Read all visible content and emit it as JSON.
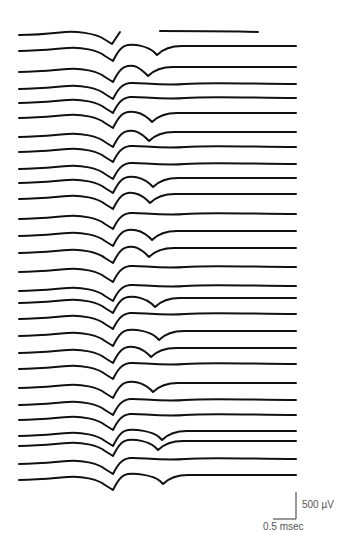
{
  "figure": {
    "type": "stacked-waveform-traces",
    "trace_color": "#111111",
    "x_start": 19,
    "x_end": 296,
    "scale_bar": {
      "vertical_label": "500 µV",
      "horizontal_label": "0.5 msec"
    },
    "traces": [
      {
        "y": 35,
        "t2": null,
        "broken": true
      },
      {
        "y": 51,
        "t2": 157
      },
      {
        "y": 72,
        "t2": 148
      },
      {
        "y": 89,
        "t2": null
      },
      {
        "y": 103,
        "t2": null
      },
      {
        "y": 118,
        "t2": 152
      },
      {
        "y": 137,
        "t2": 149
      },
      {
        "y": 152,
        "t2": null
      },
      {
        "y": 169,
        "t2": null
      },
      {
        "y": 183,
        "t2": 153
      },
      {
        "y": 199,
        "t2": 150
      },
      {
        "y": 219,
        "t2": null
      },
      {
        "y": 236,
        "t2": 152
      },
      {
        "y": 253,
        "t2": 149
      },
      {
        "y": 272,
        "t2": null
      },
      {
        "y": 291,
        "t2": null
      },
      {
        "y": 303,
        "t2": 155
      },
      {
        "y": 319,
        "t2": null
      },
      {
        "y": 336,
        "t2": 159
      },
      {
        "y": 353,
        "t2": 151
      },
      {
        "y": 369,
        "t2": null
      },
      {
        "y": 388,
        "t2": 153
      },
      {
        "y": 405,
        "t2": null
      },
      {
        "y": 420,
        "t2": null
      },
      {
        "y": 436,
        "t2": 162
      },
      {
        "y": 446,
        "t2": 158
      },
      {
        "y": 464,
        "t2": null
      },
      {
        "y": 480,
        "t2": 163
      }
    ]
  }
}
